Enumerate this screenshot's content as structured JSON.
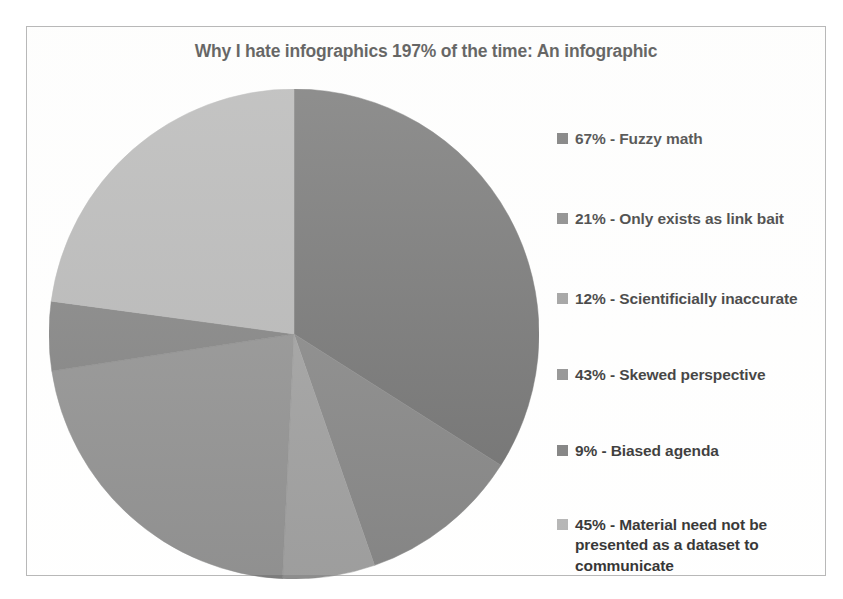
{
  "chart_data": {
    "type": "pie",
    "title": "Why I hate infographics 197% of the time: An infographic",
    "xlabel": "",
    "ylabel": "",
    "legend_position": "right",
    "grid": false,
    "total_percent": 197,
    "categories": [
      "Fuzzy math",
      "Only exists as link bait",
      "Scientificially inaccurate",
      "Skewed perspective",
      "Biased agenda",
      "Material need not be presented as a dataset to communicate"
    ],
    "values": [
      67,
      21,
      12,
      43,
      9,
      45
    ],
    "slices": [
      {
        "label": "67% - Fuzzy math",
        "percent": 67,
        "category": "Fuzzy math",
        "color": "#5a5a5a",
        "start_angle": 0,
        "sweep_angle": 122.4
      },
      {
        "label": "21% - Only exists as link bait",
        "percent": 21,
        "category": "Only exists as link bait",
        "color": "#707070",
        "start_angle": 122.4,
        "sweep_angle": 38.4
      },
      {
        "label": "12%  - Scientificially inaccurate",
        "percent": 12,
        "category": "Scientificially inaccurate",
        "color": "#8d8d8d",
        "start_angle": 160.8,
        "sweep_angle": 21.9
      },
      {
        "label": "43% - Skewed perspective",
        "percent": 43,
        "category": "Skewed perspective",
        "color": "#7d7d7d",
        "start_angle": 182.7,
        "sweep_angle": 78.6
      },
      {
        "label": "9% - Biased agenda",
        "percent": 9,
        "category": "Biased agenda",
        "color": "#6b6b6b",
        "start_angle": 261.3,
        "sweep_angle": 16.4
      },
      {
        "label": "45% - Material need not be presented as a dataset to communicate",
        "percent": 45,
        "category": "Material need not be presented as a dataset to communicate",
        "color": "#a9a9a9",
        "start_angle": 277.7,
        "sweep_angle": 82.3
      }
    ]
  },
  "legend": {
    "items": [
      {
        "label": "67% - Fuzzy math",
        "color": "#5a5a5a",
        "top": 36
      },
      {
        "label": "21% - Only exists as link bait",
        "color": "#707070",
        "top": 116
      },
      {
        "label": "12%  - Scientificially inaccurate",
        "color": "#8d8d8d",
        "top": 196
      },
      {
        "label": "43% - Skewed perspective",
        "color": "#7d7d7d",
        "top": 272
      },
      {
        "label": "9% - Biased agenda",
        "color": "#6b6b6b",
        "top": 348
      },
      {
        "label": "45% - Material need not be presented as a dataset to communicate",
        "color": "#a9a9a9",
        "top": 422
      }
    ]
  }
}
